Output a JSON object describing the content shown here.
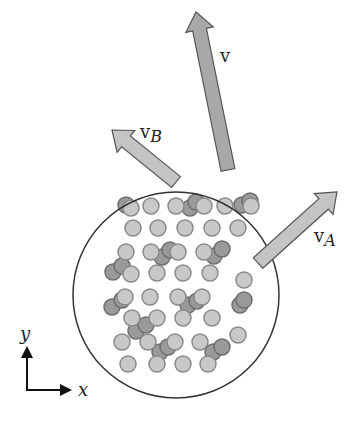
{
  "diagram": {
    "title": "",
    "labels": {
      "v": "v",
      "vB_main": "v",
      "vB_sub": "B",
      "vA_main": "v",
      "vA_sub": "A",
      "axis_x": "x",
      "axis_y": "y"
    },
    "colors": {
      "arrow_v_fill": "#a8a8a8",
      "arrow_side_fill": "#c4c4c4",
      "arrow_stroke": "#555555",
      "circle_stroke": "#333333",
      "particle_light": "#c8c8c8",
      "particle_light_stroke": "#8a8a8a",
      "particle_dark": "#9a9a9a",
      "particle_dark_stroke": "#6e6e6e"
    },
    "circle": {
      "cx": 176,
      "cy": 295,
      "r": 103
    },
    "arrows": [
      {
        "name": "v",
        "x1": 228,
        "y1": 170,
        "x2": 196,
        "y2": 12,
        "width": 14,
        "fill": "#a8a8a8"
      },
      {
        "name": "vB",
        "x1": 176,
        "y1": 182,
        "x2": 112,
        "y2": 130,
        "width": 14,
        "fill": "#c4c4c4"
      },
      {
        "name": "vA",
        "x1": 258,
        "y1": 263,
        "x2": 337,
        "y2": 192,
        "width": 14,
        "fill": "#c4c4c4"
      }
    ],
    "particles": [
      {
        "x": 126,
        "y": 205,
        "d": 1
      },
      {
        "x": 131,
        "y": 208,
        "d": 0
      },
      {
        "x": 151,
        "y": 206,
        "d": 0
      },
      {
        "x": 176,
        "y": 206,
        "d": 0
      },
      {
        "x": 190,
        "y": 208,
        "d": 1
      },
      {
        "x": 196,
        "y": 202,
        "d": 1
      },
      {
        "x": 204,
        "y": 206,
        "d": 0
      },
      {
        "x": 225,
        "y": 206,
        "d": 0
      },
      {
        "x": 242,
        "y": 205,
        "d": 1
      },
      {
        "x": 250,
        "y": 201,
        "d": 1
      },
      {
        "x": 251,
        "y": 206,
        "d": 0
      },
      {
        "x": 133,
        "y": 228,
        "d": 0
      },
      {
        "x": 158,
        "y": 228,
        "d": 0
      },
      {
        "x": 185,
        "y": 228,
        "d": 0
      },
      {
        "x": 212,
        "y": 228,
        "d": 0
      },
      {
        "x": 238,
        "y": 228,
        "d": 0
      },
      {
        "x": 126,
        "y": 252,
        "d": 0
      },
      {
        "x": 151,
        "y": 252,
        "d": 0
      },
      {
        "x": 162,
        "y": 257,
        "d": 1
      },
      {
        "x": 170,
        "y": 250,
        "d": 1
      },
      {
        "x": 178,
        "y": 252,
        "d": 0
      },
      {
        "x": 204,
        "y": 252,
        "d": 0
      },
      {
        "x": 214,
        "y": 256,
        "d": 1
      },
      {
        "x": 222,
        "y": 249,
        "d": 1
      },
      {
        "x": 113,
        "y": 272,
        "d": 1
      },
      {
        "x": 122,
        "y": 266,
        "d": 1
      },
      {
        "x": 131,
        "y": 274,
        "d": 0
      },
      {
        "x": 157,
        "y": 273,
        "d": 0
      },
      {
        "x": 183,
        "y": 273,
        "d": 0
      },
      {
        "x": 210,
        "y": 273,
        "d": 0
      },
      {
        "x": 244,
        "y": 280,
        "d": 0
      },
      {
        "x": 112,
        "y": 307,
        "d": 1
      },
      {
        "x": 122,
        "y": 300,
        "d": 1
      },
      {
        "x": 125,
        "y": 297,
        "d": 0
      },
      {
        "x": 150,
        "y": 297,
        "d": 0
      },
      {
        "x": 178,
        "y": 297,
        "d": 0
      },
      {
        "x": 188,
        "y": 305,
        "d": 1
      },
      {
        "x": 197,
        "y": 301,
        "d": 1
      },
      {
        "x": 202,
        "y": 297,
        "d": 0
      },
      {
        "x": 240,
        "y": 305,
        "d": 1
      },
      {
        "x": 244,
        "y": 300,
        "d": 1
      },
      {
        "x": 132,
        "y": 318,
        "d": 0
      },
      {
        "x": 136,
        "y": 331,
        "d": 1
      },
      {
        "x": 146,
        "y": 325,
        "d": 1
      },
      {
        "x": 157,
        "y": 318,
        "d": 0
      },
      {
        "x": 183,
        "y": 318,
        "d": 0
      },
      {
        "x": 212,
        "y": 318,
        "d": 0
      },
      {
        "x": 122,
        "y": 342,
        "d": 0
      },
      {
        "x": 148,
        "y": 342,
        "d": 0
      },
      {
        "x": 160,
        "y": 352,
        "d": 1
      },
      {
        "x": 168,
        "y": 347,
        "d": 1
      },
      {
        "x": 175,
        "y": 342,
        "d": 0
      },
      {
        "x": 200,
        "y": 342,
        "d": 0
      },
      {
        "x": 213,
        "y": 352,
        "d": 1
      },
      {
        "x": 222,
        "y": 347,
        "d": 1
      },
      {
        "x": 238,
        "y": 335,
        "d": 0
      },
      {
        "x": 128,
        "y": 364,
        "d": 0
      },
      {
        "x": 157,
        "y": 364,
        "d": 0
      },
      {
        "x": 183,
        "y": 364,
        "d": 0
      },
      {
        "x": 208,
        "y": 364,
        "d": 0
      }
    ],
    "particle_radius": 8,
    "axes": {
      "origin_x": 26,
      "origin_y": 390,
      "x_len": 44,
      "y_len": 42
    }
  }
}
